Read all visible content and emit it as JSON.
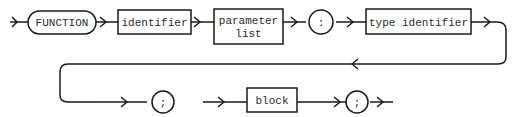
{
  "diagram": {
    "type": "syntax-diagram",
    "title": "",
    "row1": {
      "keyword": "FUNCTION",
      "box_identifier": "identifier",
      "box_parameter_list_line1": "parameter",
      "box_parameter_list_line2": "list",
      "colon": ":",
      "box_type_identifier": "type identifier"
    },
    "row2": {
      "semicolon_1": ";",
      "box_block": "block",
      "semicolon_2": ";"
    },
    "colors": {
      "stroke": "#1a1a1a",
      "background": "#ffffff"
    }
  }
}
